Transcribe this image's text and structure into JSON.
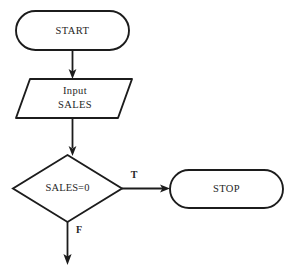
{
  "diagram": {
    "type": "flowchart",
    "background_color": "#ffffff",
    "line_color": "#1c1c1c",
    "text_color": "#262626"
  },
  "nodes": {
    "start": {
      "label": "START",
      "shape": "terminator"
    },
    "input": {
      "line1": "Input",
      "line2": "SALES",
      "shape": "parallelogram"
    },
    "decision": {
      "label": "SALES=0",
      "shape": "diamond"
    },
    "stop": {
      "label": "STOP",
      "shape": "terminator"
    }
  },
  "edges": {
    "start_to_input": {
      "label": ""
    },
    "input_to_decision": {
      "label": ""
    },
    "decision_true": {
      "label": "T"
    },
    "decision_false": {
      "label": "F"
    }
  }
}
